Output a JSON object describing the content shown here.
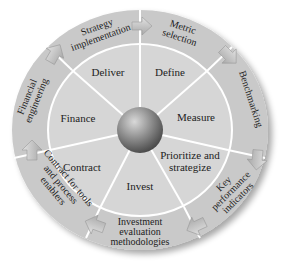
{
  "diagram": {
    "center": {
      "label": ""
    },
    "inner_sectors": [
      {
        "label": "Deliver"
      },
      {
        "label": "Define"
      },
      {
        "label": "Measure"
      },
      {
        "label_line1": "Prioritize and",
        "label_line2": "strategize"
      },
      {
        "label": "Invest"
      },
      {
        "label": "Contract"
      },
      {
        "label": "Finance"
      }
    ],
    "outer_steps": [
      {
        "line1": "Strategy",
        "line2": "implementation"
      },
      {
        "line1": "Metric",
        "line2": "selection"
      },
      {
        "line1": "Benchmarking"
      },
      {
        "line1": "Key",
        "line2": "performance",
        "line3": "indicators"
      },
      {
        "line1": "Investment",
        "line2": "evaluation",
        "line3": "methodologies"
      },
      {
        "line1": "Contract for tools",
        "line2": "and process",
        "line3": "enablers"
      },
      {
        "line1": "Financial",
        "line2": "engineering"
      }
    ],
    "colors": {
      "outer_ring": "#c9c9c9",
      "inner_disc": "#d6d6d6",
      "divider": "#ffffff",
      "sphere_light": "#cfcfcf",
      "sphere_dark": "#5a5a5a",
      "arrow": "#bdbdbd",
      "text": "#222222"
    }
  }
}
